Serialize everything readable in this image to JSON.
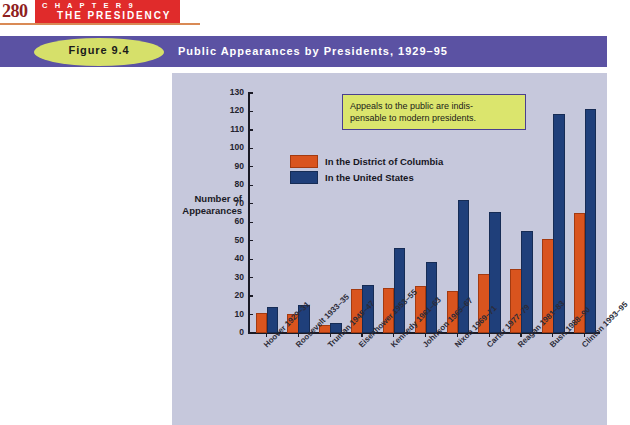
{
  "page": {
    "number": "280",
    "chapter_label": "C H A P T E R   9",
    "chapter_title": "THE PRESIDENCY"
  },
  "figure": {
    "number": "Figure 9.4",
    "title": "Public Appearances by Presidents, 1929–95"
  },
  "annotation": {
    "text": "Appeals to the public are indis-pensable to modern presidents."
  },
  "colors": {
    "banner": "#5b52a3",
    "ellipse": "#d6e06a",
    "chapter_tab": "#e02b2b",
    "panel": "#c6c8dc",
    "dc_series": "#d9541e",
    "us_series": "#1f3f7a",
    "annotation_fill": "#dbe56d",
    "annotation_border": "#4a3f8f"
  },
  "chart_data": {
    "type": "bar",
    "title": "Public Appearances by Presidents, 1929–95",
    "xlabel": "",
    "ylabel": "Number of Appearances",
    "ylim": [
      0,
      130
    ],
    "ytick_step": 10,
    "yticks": [
      0,
      10,
      20,
      30,
      40,
      50,
      60,
      70,
      80,
      90,
      100,
      110,
      120,
      130
    ],
    "grid": false,
    "legend_position": "upper-left-inside",
    "categories": [
      "Hoover 1929–31",
      "Roosevelt 1933–35",
      "Truman 1945–47",
      "Eisenhower 1953–55",
      "Kennedy 1961–63",
      "Johnson 1965–67",
      "Nixon 1969–71",
      "Carter 1977–79",
      "Reagan 1981–83",
      "Bush 1988–90",
      "Clinton 1993–95"
    ],
    "series": [
      {
        "name": "In the District of Columbia",
        "color": "#d9541e",
        "values": [
          9.5,
          9,
          3.5,
          22.5,
          23.5,
          24.5,
          21.5,
          31,
          33.5,
          50,
          64
        ]
      },
      {
        "name": "In the United States",
        "color": "#1f3f7a",
        "values": [
          13,
          14,
          4.5,
          25,
          45,
          37.5,
          71,
          64.5,
          54,
          117.5,
          120
        ]
      }
    ],
    "annotations": [
      "Appeals to the public are indis-pensable to modern presidents."
    ]
  }
}
